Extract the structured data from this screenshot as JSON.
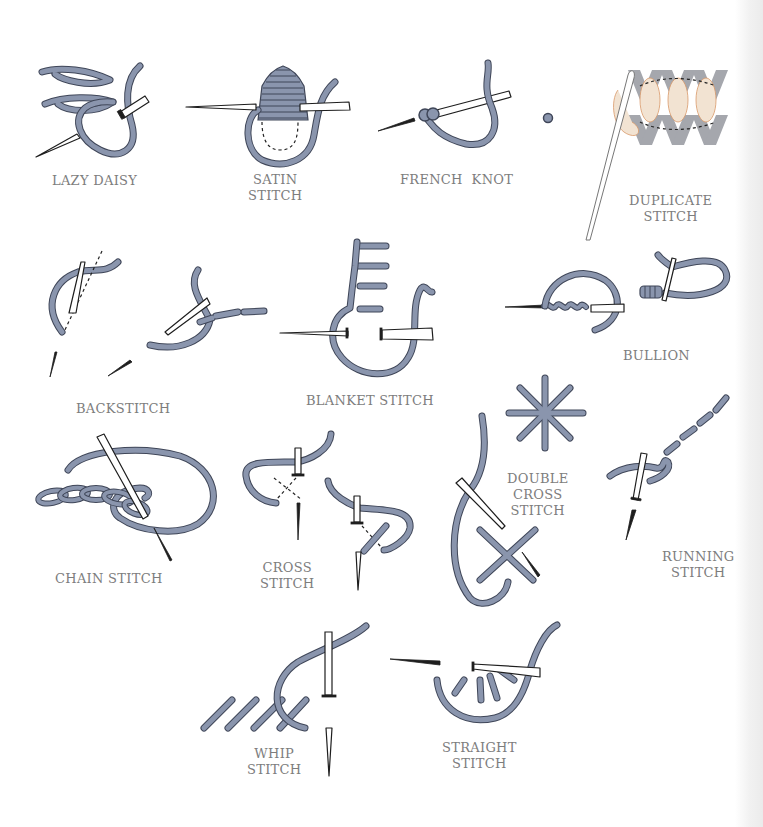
{
  "colors": {
    "thread": "#8a95ad",
    "thread_outline": "#3f4658",
    "needle": "#ffffff",
    "needle_outline": "#1e1e1e",
    "knit": "#a5a7ad",
    "duplicate_thread": "#f2e3d2",
    "duplicate_outline": "#d9996a",
    "label_text": "#7d7d7d",
    "background": "#ffffff"
  },
  "stitches": [
    {
      "id": "lazy-daisy",
      "lines": [
        "LAZY DAISY"
      ]
    },
    {
      "id": "satin-stitch",
      "lines": [
        "SATIN",
        "STITCH"
      ]
    },
    {
      "id": "french-knot",
      "lines": [
        "FRENCH  KNOT"
      ]
    },
    {
      "id": "duplicate-stitch",
      "lines": [
        "DUPLICATE",
        "STITCH"
      ]
    },
    {
      "id": "backstitch",
      "lines": [
        "BACKSTITCH"
      ]
    },
    {
      "id": "blanket-stitch",
      "lines": [
        "BLANKET STITCH"
      ]
    },
    {
      "id": "bullion",
      "lines": [
        "BULLION"
      ]
    },
    {
      "id": "chain-stitch",
      "lines": [
        "CHAIN STITCH"
      ]
    },
    {
      "id": "cross-stitch",
      "lines": [
        "CROSS",
        "STITCH"
      ]
    },
    {
      "id": "double-cross-stitch",
      "lines": [
        "DOUBLE",
        "CROSS",
        "STITCH"
      ]
    },
    {
      "id": "running-stitch",
      "lines": [
        "RUNNING",
        "STITCH"
      ]
    },
    {
      "id": "whip-stitch",
      "lines": [
        "WHIP",
        "STITCH"
      ]
    },
    {
      "id": "straight-stitch",
      "lines": [
        "STRAIGHT",
        "STITCH"
      ]
    }
  ]
}
